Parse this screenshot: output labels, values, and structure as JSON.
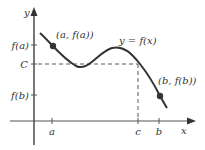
{
  "diagram": {
    "axes": {
      "x_label": "x",
      "y_label": "y"
    },
    "y_ticks": [
      {
        "label": "f(a)",
        "y": 45
      },
      {
        "label": "C",
        "y": 64
      },
      {
        "label": "f(b)",
        "y": 95
      }
    ],
    "x_ticks": [
      {
        "label": "a",
        "x": 52
      },
      {
        "label": "c",
        "x": 138
      },
      {
        "label": "b",
        "x": 159
      }
    ],
    "curve_label": "y = f(x)",
    "points": [
      {
        "label": "(a, f(a))",
        "x": 53,
        "y": 46
      },
      {
        "label": "(b, f(b))",
        "x": 160,
        "y": 96
      }
    ],
    "colors": {
      "curve": "#333333",
      "axis": "#555555",
      "dashed": "#444444"
    }
  }
}
